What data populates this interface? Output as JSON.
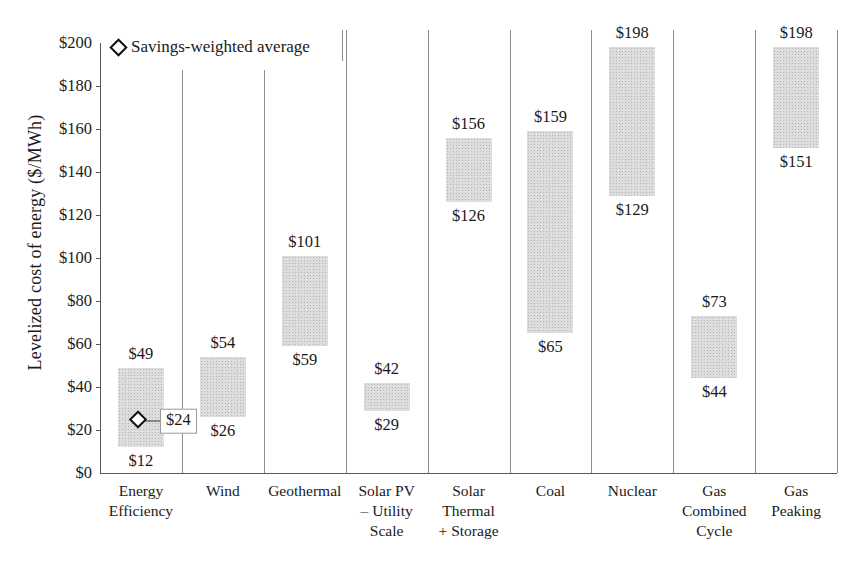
{
  "chart_data": {
    "type": "bar",
    "subtype": "floating-range-bar",
    "title": "",
    "xlabel": "",
    "ylabel": "Levelized cost of energy ($/MWh)",
    "ylim": [
      0,
      200
    ],
    "ytick_step": 20,
    "ytick_labels": [
      "$0",
      "$20",
      "$40",
      "$60",
      "$80",
      "$100",
      "$120",
      "$140",
      "$160",
      "$180",
      "$200"
    ],
    "ytick_values": [
      0,
      20,
      40,
      60,
      80,
      100,
      120,
      140,
      160,
      180,
      200
    ],
    "grid": false,
    "categories": [
      "Energy Efficiency",
      "Wind",
      "Geothermal",
      "Solar PV – Utility Scale",
      "Solar Thermal + Storage",
      "Coal",
      "Nuclear",
      "Gas Combined Cycle",
      "Gas Peaking"
    ],
    "category_label_lines": [
      [
        "Energy",
        "Efficiency"
      ],
      [
        "Wind"
      ],
      [
        "Geothermal"
      ],
      [
        "Solar PV",
        "– Utility",
        "Scale"
      ],
      [
        "Solar",
        "Thermal",
        "+ Storage"
      ],
      [
        "Coal"
      ],
      [
        "Nuclear"
      ],
      [
        "Gas",
        "Combined",
        "Cycle"
      ],
      [
        "Gas",
        "Peaking"
      ]
    ],
    "low": [
      12,
      26,
      59,
      29,
      126,
      65,
      129,
      44,
      151
    ],
    "high": [
      49,
      54,
      101,
      42,
      156,
      159,
      198,
      73,
      198
    ],
    "low_labels": [
      "$12",
      "$26",
      "$59",
      "$29",
      "$126",
      "$65",
      "$129",
      "$44",
      "$151"
    ],
    "high_labels": [
      "$49",
      "$54",
      "$101",
      "$42",
      "$156",
      "$159",
      "$198",
      "$73",
      "$198"
    ],
    "markers": [
      {
        "category": "Energy Efficiency",
        "value": 24,
        "label": "$24",
        "name": "Savings-weighted average"
      }
    ],
    "bar_color": "#dcdcdc"
  },
  "legend": {
    "position": "top-left",
    "entries": [
      {
        "marker": "diamond",
        "label": "Savings-weighted average"
      }
    ]
  }
}
